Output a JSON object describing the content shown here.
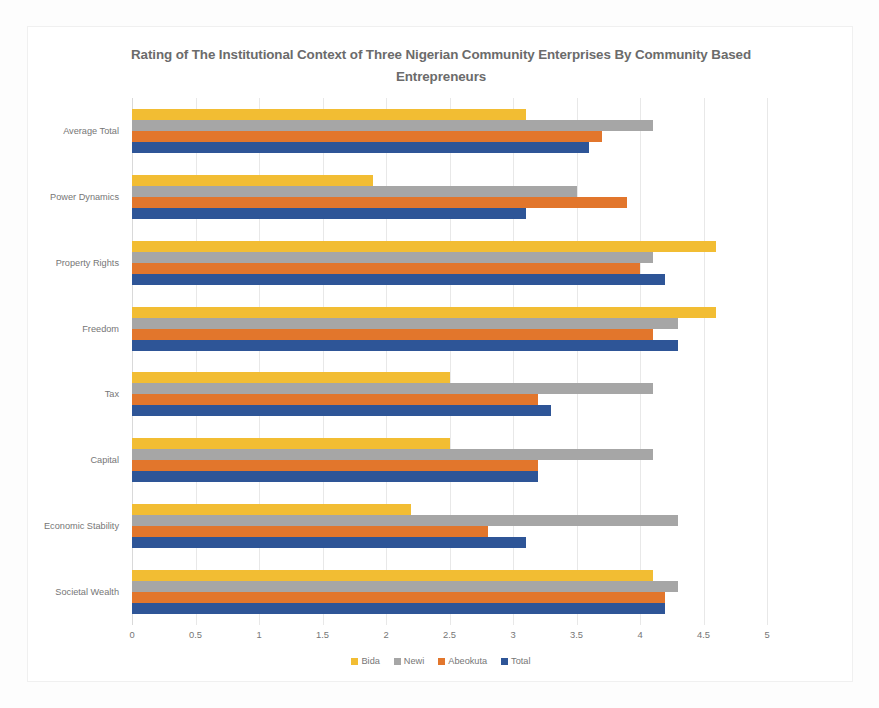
{
  "chart_data": {
    "type": "bar",
    "orientation": "horizontal",
    "title": "Rating of The Institutional Context of Three Nigerian Community Enterprises By Community Based Entrepreneurs",
    "xlabel": "",
    "ylabel": "",
    "xlim": [
      0,
      5
    ],
    "xticks": [
      "0",
      "0.5",
      "1",
      "1.5",
      "2",
      "2.5",
      "3",
      "3.5",
      "4",
      "4.5",
      "5"
    ],
    "xtick_values": [
      0,
      0.5,
      1,
      1.5,
      2,
      2.5,
      3,
      3.5,
      4,
      4.5,
      5
    ],
    "grid": "vertical",
    "legend_position": "bottom",
    "categories": [
      "Average Total",
      "Power Dynamics",
      "Property Rights",
      "Freedom",
      "Tax",
      "Capital",
      "Economic Stability",
      "Societal Wealth"
    ],
    "series": [
      {
        "name": "Bida",
        "color": "#f2bd33",
        "values": [
          3.1,
          1.9,
          4.6,
          4.6,
          2.5,
          2.5,
          2.2,
          4.1
        ]
      },
      {
        "name": "Newi",
        "color": "#a6a6a6",
        "values": [
          4.1,
          3.5,
          4.1,
          4.3,
          4.1,
          4.1,
          4.3,
          4.3
        ]
      },
      {
        "name": "Abeokuta",
        "color": "#e2762c",
        "values": [
          3.7,
          3.9,
          4.0,
          4.1,
          3.2,
          3.2,
          2.8,
          4.2
        ]
      },
      {
        "name": "Total",
        "color": "#2e5597",
        "values": [
          3.6,
          3.1,
          4.2,
          4.3,
          3.3,
          3.2,
          3.1,
          4.2
        ]
      }
    ]
  }
}
